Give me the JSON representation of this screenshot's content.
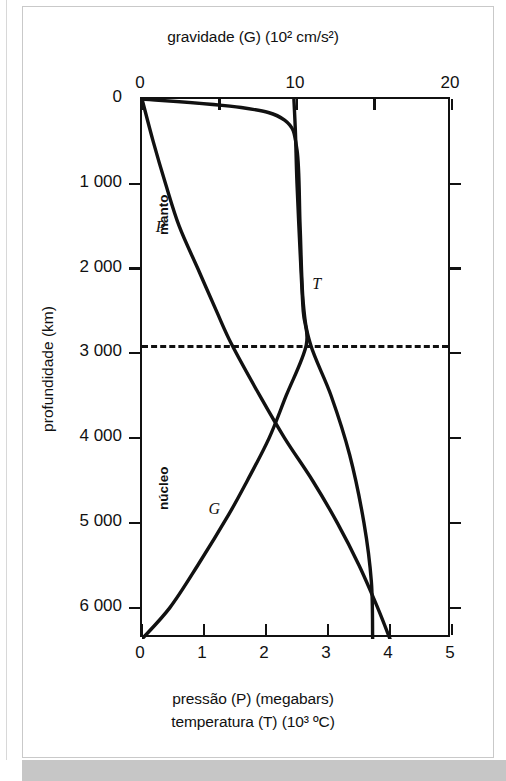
{
  "figure": {
    "top_axis_title": "gravidade (G) (10² cm/s²)",
    "bottom_axis_title_1": "pressão (P) (megabars)",
    "bottom_axis_title_2": "temperatura (T) (10³ ºC)",
    "y_axis_title": "profundidade (km)",
    "region_mantle": "manto",
    "region_core": "núcleo",
    "label_P": "P",
    "label_T": "T",
    "label_G": "G"
  },
  "chart_data": {
    "type": "line",
    "orientation": "vertical-depth",
    "grid": false,
    "legend": "inline curve labels (P, T, G)",
    "ylabel": "profundidade (km)",
    "ylim": [
      0,
      6370
    ],
    "y_ticks": [
      0,
      1000,
      2000,
      3000,
      4000,
      5000,
      6000
    ],
    "y_tick_labels": [
      "0",
      "1 000",
      "2 000",
      "3 000",
      "4 000",
      "5 000",
      "6 000"
    ],
    "y_inverted": true,
    "top_axis": {
      "label": "gravidade (G) (10² cm/s²)",
      "lim": [
        0,
        20
      ],
      "ticks": [
        0,
        5,
        10,
        15,
        20
      ],
      "tick_labels": [
        "0",
        "",
        "10",
        "",
        "20"
      ]
    },
    "bottom_axis": {
      "label_1": "pressão (P) (megabars)",
      "label_2": "temperatura (T) (10³ ºC)",
      "lim": [
        0,
        5
      ],
      "ticks": [
        0,
        1,
        2,
        3,
        4,
        5
      ],
      "tick_labels": [
        "0",
        "1",
        "2",
        "3",
        "4",
        "5"
      ]
    },
    "annotations": [
      {
        "text": "manto",
        "depth_range": [
          0,
          2900
        ],
        "type": "region"
      },
      {
        "text": "núcleo",
        "depth_range": [
          2900,
          6370
        ],
        "type": "region"
      },
      {
        "text": "core-mantle boundary (dashed)",
        "depth": 2900,
        "type": "hline"
      }
    ],
    "series": [
      {
        "name": "P",
        "label": "pressão (P)",
        "axis": "bottom",
        "units": "megabars",
        "points": [
          {
            "depth": 0,
            "value": 0.0
          },
          {
            "depth": 500,
            "value": 0.18
          },
          {
            "depth": 1000,
            "value": 0.38
          },
          {
            "depth": 1500,
            "value": 0.6
          },
          {
            "depth": 2000,
            "value": 0.9
          },
          {
            "depth": 2500,
            "value": 1.2
          },
          {
            "depth": 2900,
            "value": 1.45
          },
          {
            "depth": 3500,
            "value": 1.9
          },
          {
            "depth": 4000,
            "value": 2.3
          },
          {
            "depth": 4500,
            "value": 2.75
          },
          {
            "depth": 5000,
            "value": 3.15
          },
          {
            "depth": 5500,
            "value": 3.5
          },
          {
            "depth": 6000,
            "value": 3.8
          },
          {
            "depth": 6370,
            "value": 4.0
          }
        ]
      },
      {
        "name": "T",
        "label": "temperatura (T)",
        "axis": "bottom",
        "units": "10³ ºC",
        "points": [
          {
            "depth": 0,
            "value": 0.0
          },
          {
            "depth": 100,
            "value": 1.6
          },
          {
            "depth": 250,
            "value": 2.3
          },
          {
            "depth": 600,
            "value": 2.5
          },
          {
            "depth": 1500,
            "value": 2.55
          },
          {
            "depth": 2400,
            "value": 2.6
          },
          {
            "depth": 2900,
            "value": 2.72
          },
          {
            "depth": 3500,
            "value": 3.05
          },
          {
            "depth": 4200,
            "value": 3.35
          },
          {
            "depth": 5000,
            "value": 3.58
          },
          {
            "depth": 5700,
            "value": 3.7
          },
          {
            "depth": 6370,
            "value": 3.72
          }
        ]
      },
      {
        "name": "G",
        "label": "gravidade (G)",
        "axis": "top",
        "units": "10² cm/s²",
        "points": [
          {
            "depth": 0,
            "value": 9.8
          },
          {
            "depth": 400,
            "value": 9.9
          },
          {
            "depth": 1000,
            "value": 10.0
          },
          {
            "depth": 1800,
            "value": 10.2
          },
          {
            "depth": 2500,
            "value": 10.4
          },
          {
            "depth": 2900,
            "value": 10.6
          },
          {
            "depth": 3500,
            "value": 9.3
          },
          {
            "depth": 4000,
            "value": 8.2
          },
          {
            "depth": 4500,
            "value": 6.8
          },
          {
            "depth": 4900,
            "value": 5.6
          },
          {
            "depth": 5500,
            "value": 3.6
          },
          {
            "depth": 6000,
            "value": 1.8
          },
          {
            "depth": 6370,
            "value": 0.0
          }
        ]
      }
    ]
  }
}
